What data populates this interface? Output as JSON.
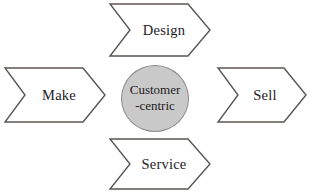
{
  "diagram": {
    "background_color": "#ffffff",
    "outline_color": "#595552",
    "shape_fill": "#ffffff",
    "center": {
      "shape": "circle",
      "fill_color": "#c9c9c9",
      "border_color": "#8a8a8a",
      "text_color": "#22201f",
      "line1": "Customer",
      "line2": "-centric"
    },
    "arrows": [
      {
        "id": "design",
        "label": "Design",
        "position": "top",
        "shape": "chevron-right",
        "icon": "chevron-right-arrow-shape"
      },
      {
        "id": "make",
        "label": "Make",
        "position": "left",
        "shape": "chevron-right",
        "icon": "chevron-right-arrow-shape"
      },
      {
        "id": "sell",
        "label": "Sell",
        "position": "right",
        "shape": "chevron-right",
        "icon": "chevron-right-arrow-shape"
      },
      {
        "id": "service",
        "label": "Service",
        "position": "bottom",
        "shape": "chevron-right",
        "icon": "chevron-right-arrow-shape"
      }
    ]
  }
}
